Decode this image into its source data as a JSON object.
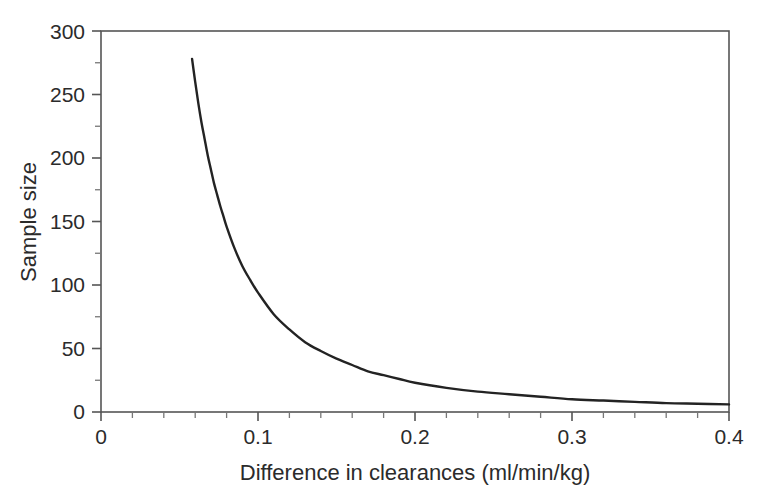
{
  "chart_data": {
    "type": "line",
    "title": "",
    "subtitle": "",
    "xlabel": "Difference in clearances (ml/min/kg)",
    "ylabel": "Sample size",
    "xlim": [
      0,
      0.4
    ],
    "ylim": [
      0,
      300
    ],
    "grid": false,
    "legend": null,
    "annotations": [],
    "x_ticks_major": [
      0,
      0.1,
      0.2,
      0.3,
      0.4
    ],
    "x_tick_labels": [
      "0",
      "0.1",
      "0.2",
      "0.3",
      "0.4"
    ],
    "x_ticks_minor": [
      0.02,
      0.04,
      0.06,
      0.08,
      0.12,
      0.14,
      0.16,
      0.18,
      0.22,
      0.24,
      0.26,
      0.28,
      0.32,
      0.34,
      0.36,
      0.38
    ],
    "y_ticks_major": [
      0,
      50,
      100,
      150,
      200,
      250,
      300
    ],
    "y_tick_labels": [
      "0",
      "50",
      "100",
      "150",
      "200",
      "250",
      "300"
    ],
    "y_ticks_minor": [
      25,
      75,
      125,
      175,
      225,
      275
    ],
    "series": [
      {
        "name": "Required sample size",
        "color": "#232323",
        "relation": "n = 0.935 / d^2",
        "x": [
          0.058,
          0.06,
          0.062,
          0.064,
          0.066,
          0.068,
          0.07,
          0.072,
          0.074,
          0.076,
          0.078,
          0.08,
          0.085,
          0.09,
          0.095,
          0.1,
          0.11,
          0.12,
          0.13,
          0.14,
          0.15,
          0.16,
          0.17,
          0.18,
          0.19,
          0.2,
          0.22,
          0.24,
          0.26,
          0.28,
          0.3,
          0.32,
          0.34,
          0.36,
          0.38,
          0.4
        ],
        "values": [
          278,
          260,
          243,
          228,
          215,
          202,
          191,
          180,
          171,
          162,
          154,
          146,
          129,
          115,
          104,
          94,
          77,
          65,
          55,
          48,
          42,
          37,
          32,
          29,
          26,
          23,
          19,
          16,
          14,
          12,
          10,
          9,
          8,
          7,
          6.5,
          6
        ]
      }
    ]
  },
  "axes": {
    "frame_color": "#555555",
    "curve_color": "#232323",
    "background": "#ffffff"
  }
}
